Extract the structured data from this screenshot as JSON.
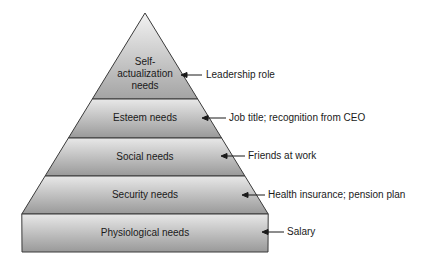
{
  "diagram": {
    "type": "pyramid",
    "tiers": [
      {
        "label_lines": [
          "Self-",
          "actualization",
          "needs"
        ],
        "annotation": "Leadership role"
      },
      {
        "label_lines": [
          "Esteem needs"
        ],
        "annotation": "Job title; recognition from CEO"
      },
      {
        "label_lines": [
          "Social needs"
        ],
        "annotation": "Friends at work"
      },
      {
        "label_lines": [
          "Security needs"
        ],
        "annotation": "Health insurance; pension plan"
      },
      {
        "label_lines": [
          "Physiological needs"
        ],
        "annotation": "Salary"
      }
    ],
    "colors": {
      "tier_light": "#e6e6e6",
      "tier_dark": "#9a9a9a",
      "outline": "#3a3a3a",
      "text": "#1a1a1a"
    }
  }
}
